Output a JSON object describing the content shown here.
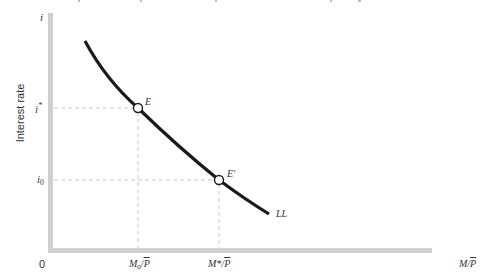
{
  "diagram": {
    "type": "money-market-liquidity-curve",
    "y_axis": {
      "symbol": "i",
      "title": "Interest rate",
      "ticks": [
        {
          "label": "i*",
          "base": "i",
          "sup": "*"
        },
        {
          "label": "i0",
          "base": "i",
          "sub": "0"
        }
      ]
    },
    "x_axis": {
      "origin": "0",
      "title": "M/P",
      "title_base": "M/",
      "title_over": "P",
      "ticks": [
        {
          "label": "M0/P",
          "base": "M",
          "sub": "0",
          "slash": "/",
          "over": "P"
        },
        {
          "label": "M*/P",
          "base": "M*",
          "slash": "/",
          "over": "P"
        }
      ]
    },
    "curve": {
      "label": "LL"
    },
    "points": [
      {
        "label": "E",
        "at": "(M0/P, i*)"
      },
      {
        "label": "E'",
        "at": "(M*/P, i0)"
      }
    ],
    "colors": {
      "axis": "#cfcfcf",
      "curve": "#1a1a1a",
      "guide": "#c8c8c8",
      "text": "#333333"
    }
  }
}
